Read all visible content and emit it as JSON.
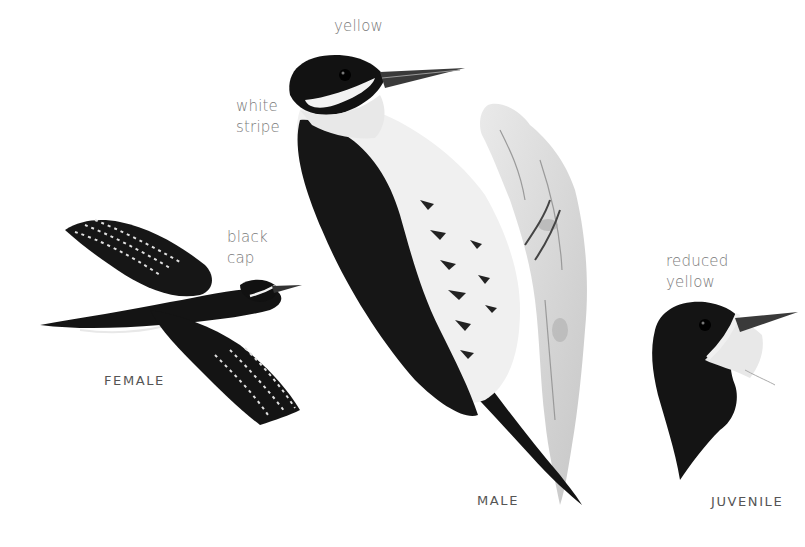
{
  "illustration": {
    "subject": "woodpecker",
    "birds": [
      {
        "id": "female",
        "caption": "FEMALE",
        "pose": "flying",
        "annotation": "black\ncap"
      },
      {
        "id": "male",
        "caption": "MALE",
        "pose": "clinging to tree bark",
        "annotations": [
          "yellow",
          "white\nstripe"
        ]
      },
      {
        "id": "juvenile",
        "caption": "JUVENILE",
        "pose": "head portrait",
        "annotation": "reduced\nyellow"
      }
    ]
  },
  "labels": {
    "yellow": "yellow",
    "white_stripe": "white\nstripe",
    "black_cap": "black\ncap",
    "reduced_yellow": "reduced\nyellow"
  },
  "captions": {
    "female": "FEMALE",
    "male": "MALE",
    "juvenile": "JUVENILE"
  },
  "colors": {
    "background": "#ffffff",
    "label_text": "#7a7a7a",
    "caption_text": "#555555",
    "plumage_black": "#141414",
    "plumage_white": "#f2f2f2",
    "bark": "#c8c8c8"
  }
}
